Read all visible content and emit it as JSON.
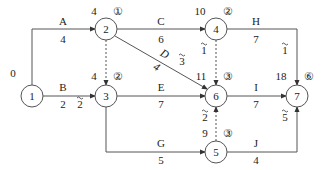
{
  "diagram": {
    "type": "double-code network (activity-on-arrow) with time-scaled labels",
    "nodes": [
      {
        "id": "1",
        "label": "1",
        "x": 32,
        "y": 96,
        "time": "0",
        "time_pos": [
          13,
          77
        ]
      },
      {
        "id": "2",
        "label": "2",
        "x": 106,
        "y": 29,
        "time": "4",
        "circled": "①",
        "time_pos": [
          94,
          15
        ],
        "circ_pos": [
          118,
          15
        ]
      },
      {
        "id": "3",
        "label": "3",
        "x": 106,
        "y": 96,
        "time": "4",
        "circled": "②",
        "time_pos": [
          94,
          80
        ],
        "circ_pos": [
          118,
          80
        ]
      },
      {
        "id": "4",
        "label": "4",
        "x": 216,
        "y": 29,
        "time": "10",
        "circled": "②",
        "time_pos": [
          200,
          15
        ],
        "circ_pos": [
          228,
          15
        ]
      },
      {
        "id": "6",
        "label": "6",
        "x": 216,
        "y": 96,
        "time": "11",
        "circled": "③",
        "time_pos": [
          201,
          80
        ],
        "circ_pos": [
          228,
          80
        ]
      },
      {
        "id": "7",
        "label": "7",
        "x": 297,
        "y": 96,
        "time": "18",
        "circled": "⑥",
        "time_pos": [
          281,
          80
        ],
        "circ_pos": [
          309,
          80
        ]
      },
      {
        "id": "5",
        "label": "5",
        "x": 216,
        "y": 152,
        "time": "9",
        "circled": "③",
        "time_pos": [
          205,
          137
        ],
        "circ_pos": [
          228,
          137
        ]
      }
    ],
    "activities": [
      {
        "name": "A",
        "duration": "4",
        "from": "1",
        "to": "2",
        "name_pos": [
          63,
          25
        ],
        "dur_pos": [
          63,
          43
        ]
      },
      {
        "name": "B",
        "duration": "2",
        "float": "2",
        "from": "1",
        "to": "3",
        "name_pos": [
          63,
          91
        ],
        "dur_pos": [
          63,
          108
        ],
        "float_pos": [
          80,
          108
        ]
      },
      {
        "name": "C",
        "duration": "6",
        "from": "2",
        "to": "4",
        "name_pos": [
          161,
          25
        ],
        "dur_pos": [
          161,
          43
        ]
      },
      {
        "name": "D",
        "duration": "4",
        "float": "3",
        "from": "2",
        "to": "6",
        "name_pos": [
          163,
          57
        ],
        "dur_pos": [
          155,
          70
        ],
        "float_pos": [
          182,
          65
        ]
      },
      {
        "name": "E",
        "duration": "7",
        "from": "3",
        "to": "6",
        "name_pos": [
          161,
          91
        ],
        "dur_pos": [
          161,
          108
        ]
      },
      {
        "name": "G",
        "duration": "5",
        "from": "3",
        "to": "5",
        "name_pos": [
          161,
          147
        ],
        "dur_pos": [
          161,
          164
        ]
      },
      {
        "name": "H",
        "duration": "7",
        "float": "1",
        "from": "4",
        "to": "7",
        "name_pos": [
          256,
          25
        ],
        "dur_pos": [
          256,
          43
        ],
        "float_pos": [
          285,
          54
        ]
      },
      {
        "name": "I",
        "duration": "7",
        "from": "6",
        "to": "7",
        "name_pos": [
          256,
          91
        ],
        "dur_pos": [
          256,
          108
        ]
      },
      {
        "name": "J",
        "duration": "4",
        "float": "5",
        "from": "5",
        "to": "7",
        "name_pos": [
          256,
          147
        ],
        "dur_pos": [
          256,
          164
        ],
        "float_pos": [
          285,
          121
        ]
      }
    ],
    "dummies": [
      {
        "from": "2",
        "to": "3"
      },
      {
        "from": "4",
        "to": "6",
        "float": "1",
        "float_pos": [
          204,
          54
        ]
      },
      {
        "from": "5",
        "to": "6",
        "float": "2",
        "float_pos": [
          205,
          121
        ]
      }
    ],
    "colors": {
      "line": "#555555",
      "text": "#222222",
      "background": "#ffffff"
    }
  }
}
